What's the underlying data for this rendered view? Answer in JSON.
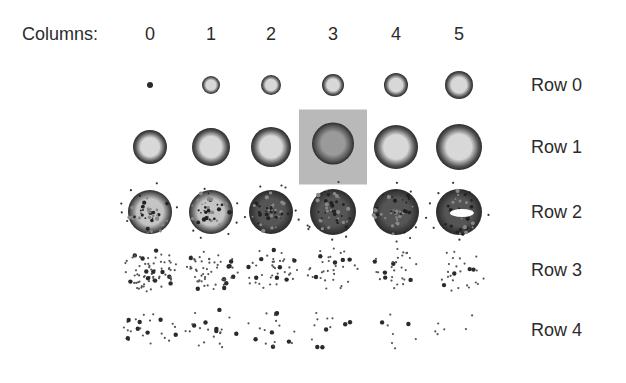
{
  "header": {
    "columns_label": "Columns:"
  },
  "columns": [
    "0",
    "1",
    "2",
    "3",
    "4",
    "5"
  ],
  "rows": [
    "Row 0",
    "Row 1",
    "Row 2",
    "Row 3",
    "Row 4"
  ],
  "highlight": {
    "row": 1,
    "column": 3,
    "color": "#b9b9b9"
  },
  "colors": {
    "colony_edge": "#2a2a2a",
    "colony_center": "#d8d8d8",
    "background": "#ffffff"
  },
  "grid": {
    "col_x": [
      150,
      211,
      271,
      333,
      396,
      459
    ],
    "row_y": [
      85,
      147,
      212,
      270,
      330
    ]
  },
  "spots": [
    [
      {
        "type": "dot",
        "r": 3
      },
      {
        "type": "ring",
        "r": 9
      },
      {
        "type": "ring",
        "r": 10
      },
      {
        "type": "ring",
        "r": 11
      },
      {
        "type": "ring",
        "r": 12
      },
      {
        "type": "ring",
        "r": 14
      }
    ],
    [
      {
        "type": "ring",
        "r": 17
      },
      {
        "type": "ring",
        "r": 19
      },
      {
        "type": "ring",
        "r": 20
      },
      {
        "type": "dark",
        "r": 21
      },
      {
        "type": "ring",
        "r": 22
      },
      {
        "type": "ring",
        "r": 23
      }
    ],
    [
      {
        "type": "mottled",
        "r": 22
      },
      {
        "type": "mottled",
        "r": 22
      },
      {
        "type": "dense",
        "r": 22
      },
      {
        "type": "dense",
        "r": 23
      },
      {
        "type": "dense",
        "r": 23
      },
      {
        "type": "broken",
        "r": 23
      }
    ],
    [
      {
        "type": "sparse",
        "n": 70
      },
      {
        "type": "sparse",
        "n": 55
      },
      {
        "type": "sparse",
        "n": 42
      },
      {
        "type": "sparse",
        "n": 34
      },
      {
        "type": "sparse",
        "n": 30
      },
      {
        "type": "sparse",
        "n": 26
      }
    ],
    [
      {
        "type": "sparse",
        "n": 24
      },
      {
        "type": "sparse",
        "n": 22
      },
      {
        "type": "sparse",
        "n": 18
      },
      {
        "type": "sparse",
        "n": 12
      },
      {
        "type": "sparse",
        "n": 8
      },
      {
        "type": "sparse",
        "n": 6
      }
    ]
  ]
}
